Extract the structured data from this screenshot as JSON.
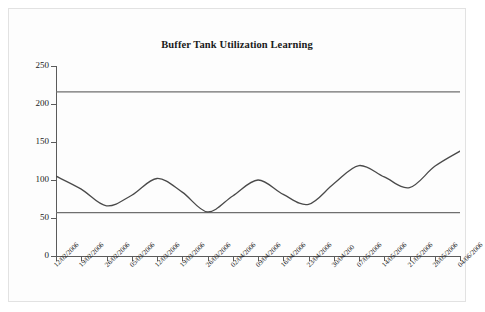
{
  "chart_data": {
    "type": "line",
    "title": "Buffer Tank Utilization Learning",
    "xlabel": "",
    "ylabel": "",
    "ylim": [
      0,
      250
    ],
    "yticks": [
      0,
      50,
      100,
      150,
      200,
      250
    ],
    "grid": false,
    "legend": null,
    "categories": [
      "12/02/2006",
      "19/02/2006",
      "26/02/2006",
      "05/03/2006",
      "12/03/2006",
      "19/03/2006",
      "26/03/2006",
      "02/04/2006",
      "09/04/2006",
      "16/04/2006",
      "23/04/2006",
      "30/04/200",
      "07/05/2006",
      "14/05/2006",
      "21/05/2006",
      "28/05/2006",
      "04/06/2006"
    ],
    "series": [
      {
        "name": "Buffer tank utilization",
        "values": [
          105,
          88,
          66,
          80,
          102,
          84,
          58,
          79,
          100,
          81,
          68,
          95,
          119,
          104,
          90,
          118,
          138
        ]
      },
      {
        "name": "Upper reference limit",
        "values": [
          216,
          216,
          216,
          216,
          216,
          216,
          216,
          216,
          216,
          216,
          216,
          216,
          216,
          216,
          216,
          216,
          216
        ]
      },
      {
        "name": "Lower reference limit",
        "values": [
          57,
          57,
          57,
          57,
          57,
          57,
          57,
          57,
          57,
          57,
          57,
          57,
          57,
          57,
          57,
          57,
          57
        ]
      }
    ],
    "colors": {
      "curve": "#4a4a4a",
      "reference_line": "#6f6f6f",
      "axis": "#5b5b5b",
      "text": "#1a1a1a",
      "background": "#fdfdfd"
    }
  }
}
